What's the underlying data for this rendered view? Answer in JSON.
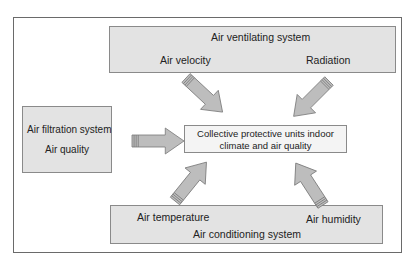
{
  "diagram": {
    "top_box": {
      "title": "Air ventilating system",
      "factors": [
        "Air velocity",
        "Radiation"
      ]
    },
    "left_box": {
      "title": "Air filtration system",
      "factors": [
        "Air quality"
      ]
    },
    "bottom_box": {
      "title": "Air conditioning system",
      "factors": [
        "Air temperature",
        "Air humidity"
      ]
    },
    "center_box": {
      "line1": "Collective protective units indoor",
      "line2": "climate and air quality"
    },
    "colors": {
      "box_fill": "#e3e3e3",
      "center_fill": "#f4f4f4",
      "arrow_fill": "#bdbdbd",
      "border": "#8a8a8a"
    }
  }
}
